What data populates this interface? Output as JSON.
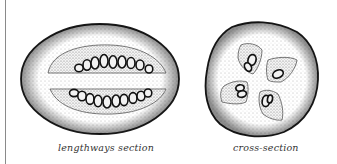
{
  "figure": {
    "panels": [
      {
        "id": "lengthways",
        "caption": "lengthways section"
      },
      {
        "id": "cross",
        "caption": "cross-section"
      }
    ],
    "colors": {
      "outline": "#1a1a1a",
      "flesh_stipple": "#bdbdbd",
      "background": "#ffffff",
      "rule": "#8a8a8a"
    }
  }
}
